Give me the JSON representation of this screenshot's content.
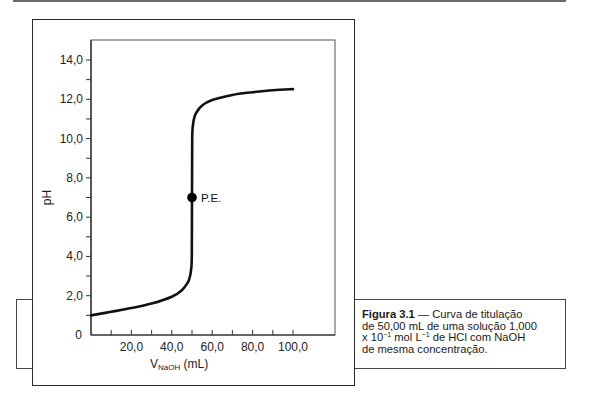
{
  "chart_data": {
    "type": "line",
    "title": "",
    "xlabel": "V_NaOH (mL)",
    "xlabel_main": "V",
    "xlabel_sub": "NaOH",
    "xlabel_unit": " (mL)",
    "ylabel": "pH",
    "xlim": [
      0,
      100
    ],
    "ylim": [
      0,
      14
    ],
    "grid": false,
    "x_ticks": [
      {
        "value": 20,
        "label": "20,0"
      },
      {
        "value": 40,
        "label": "40,0"
      },
      {
        "value": 60,
        "label": "60,0"
      },
      {
        "value": 80,
        "label": "80,0"
      },
      {
        "value": 100,
        "label": "100,0"
      }
    ],
    "x_minor_step": 10,
    "y_ticks": [
      {
        "value": 0,
        "label": "0"
      },
      {
        "value": 2,
        "label": "2,0"
      },
      {
        "value": 4,
        "label": "4,0"
      },
      {
        "value": 6,
        "label": "6,0"
      },
      {
        "value": 8,
        "label": "8,0"
      },
      {
        "value": 10,
        "label": "10,0"
      },
      {
        "value": 12,
        "label": "12,0"
      },
      {
        "value": 14,
        "label": "14,0"
      }
    ],
    "y_minor_step": 1,
    "series": [
      {
        "name": "Curva de titulação HCl com NaOH",
        "x": [
          0,
          10,
          20,
          30,
          40,
          45,
          48,
          49,
          49.5,
          49.9,
          50,
          50.1,
          50.5,
          51,
          52,
          55,
          60,
          70,
          80,
          90,
          100
        ],
        "y": [
          1.0,
          1.18,
          1.37,
          1.6,
          1.95,
          2.28,
          2.69,
          3.0,
          3.3,
          4.0,
          7.0,
          10.0,
          10.7,
          11.0,
          11.29,
          11.68,
          11.96,
          12.22,
          12.36,
          12.46,
          12.52
        ]
      }
    ],
    "annotations": [
      {
        "type": "point",
        "x": 50,
        "y": 7.0,
        "label": "P.E."
      }
    ]
  },
  "caption": {
    "figure_label": "Figura 3.1",
    "dash": " — ",
    "line1_rest": "Curva de titulação",
    "line2": "de 50,00 mL de uma solução 1,000",
    "line3_a": "x 10",
    "line3_exp1": "−1",
    "line3_b": " mol L",
    "line3_exp2": "−1",
    "line3_c": " de HCl com NaOH",
    "line4": "de mesma concentração."
  }
}
